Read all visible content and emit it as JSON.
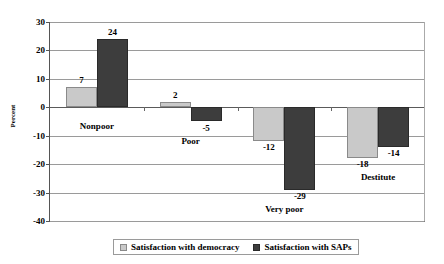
{
  "chart_data": {
    "type": "bar",
    "title": "",
    "subtitle": "",
    "xlabel": "",
    "ylabel": "Percent",
    "ylim": [
      -40,
      30
    ],
    "ytick_labels": [
      "30",
      "20",
      "10",
      "0",
      "-10",
      "-20",
      "-30",
      "-40"
    ],
    "ytick_values": [
      30,
      20,
      10,
      0,
      -10,
      -20,
      -30,
      -40
    ],
    "grid": true,
    "legend_position": "bottom",
    "categories": [
      "Nonpoor",
      "Poor",
      "Very poor",
      "Destitute"
    ],
    "series": [
      {
        "name": "Satisfaction with democracy",
        "color": "#c9c9c9",
        "values": [
          7,
          2,
          -12,
          -18
        ],
        "labels": [
          "7",
          "2",
          "-12",
          "-18"
        ]
      },
      {
        "name": "Satisfaction with SAPs",
        "color": "#3d3d3d",
        "values": [
          24,
          -5,
          -29,
          -14
        ],
        "labels": [
          "24",
          "-5",
          "-29",
          "-14"
        ]
      }
    ]
  },
  "legend": {
    "items": [
      {
        "label": "Satisfaction with democracy",
        "swatch": "light"
      },
      {
        "label": "Satisfaction with SAPs",
        "swatch": "dark"
      }
    ]
  }
}
